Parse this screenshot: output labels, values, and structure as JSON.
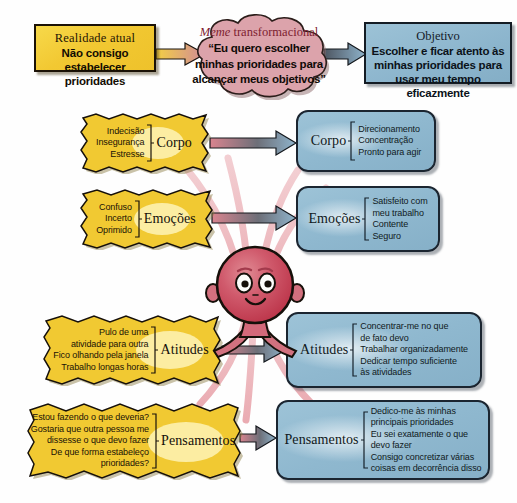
{
  "diagram": {
    "title_row": {
      "current_reality": {
        "header": "Realidade atual",
        "body_line1": "Não consigo",
        "body_line2": "estabelecer prioridades"
      },
      "meme": {
        "header_italic": "Meme",
        "header_rest": " transformacional",
        "body_line1": "“Eu quero escolher",
        "body_line2": "minhas prioridades para",
        "body_line3": "alcançar meus objetivos”"
      },
      "objective": {
        "header": "Objetivo",
        "body_line1": "Escolher e ficar atento às",
        "body_line2": "minhas prioridades para",
        "body_line3": "usar meu tempo eficazmente"
      }
    },
    "rows": [
      {
        "id": "corpo",
        "label": "Corpo",
        "problem_items": [
          "Indecisão",
          "Insegurança",
          "Estresse"
        ],
        "solution_label": "Corpo",
        "solution_items": [
          "Direcionamento",
          "Concentração",
          "Pronto para agir"
        ]
      },
      {
        "id": "emocoes",
        "label": "Emoções",
        "problem_items": [
          "Confuso",
          "Incerto",
          "Oprimido"
        ],
        "solution_label": "Emoções",
        "solution_items": [
          "Satisfeito com\nmeu trabalho",
          "Contente",
          "Seguro"
        ]
      },
      {
        "id": "atitudes",
        "label": "Atitudes",
        "problem_items": [
          "Pulo de uma\natividade para outra",
          "Fico olhando pela janela",
          "Trabalho longas horas"
        ],
        "solution_label": "Atitudes",
        "solution_items": [
          "Concentrar-me no que\nde fato devo",
          "Trabalhar organizadamente",
          "Dedicar tempo suficiente\nàs atividades"
        ]
      },
      {
        "id": "pensamentos",
        "label": "Pensamentos",
        "problem_items": [
          "Estou fazendo o que deveria?",
          "Gostaria que outra pessoa me\ndissesse o que devo fazer",
          "De que forma estabeleço\nprioridades?"
        ],
        "solution_label": "Pensamentos",
        "solution_items": [
          "Dedico-me às minhas\nprincipais prioridades",
          "Eu sei exatamente o que\ndevo fazer",
          "Consigo concretizar várias\ncoisas em decorrência disso"
        ]
      }
    ],
    "character": {
      "name": "round-head-figure",
      "color": "#cf4a60"
    },
    "colors": {
      "yellow": "#f2c832",
      "blue": "#8fb8cf",
      "cloud_pink": "#dc9aa4",
      "ray_pink": "#e29aa2",
      "outline": "#16100a"
    }
  }
}
